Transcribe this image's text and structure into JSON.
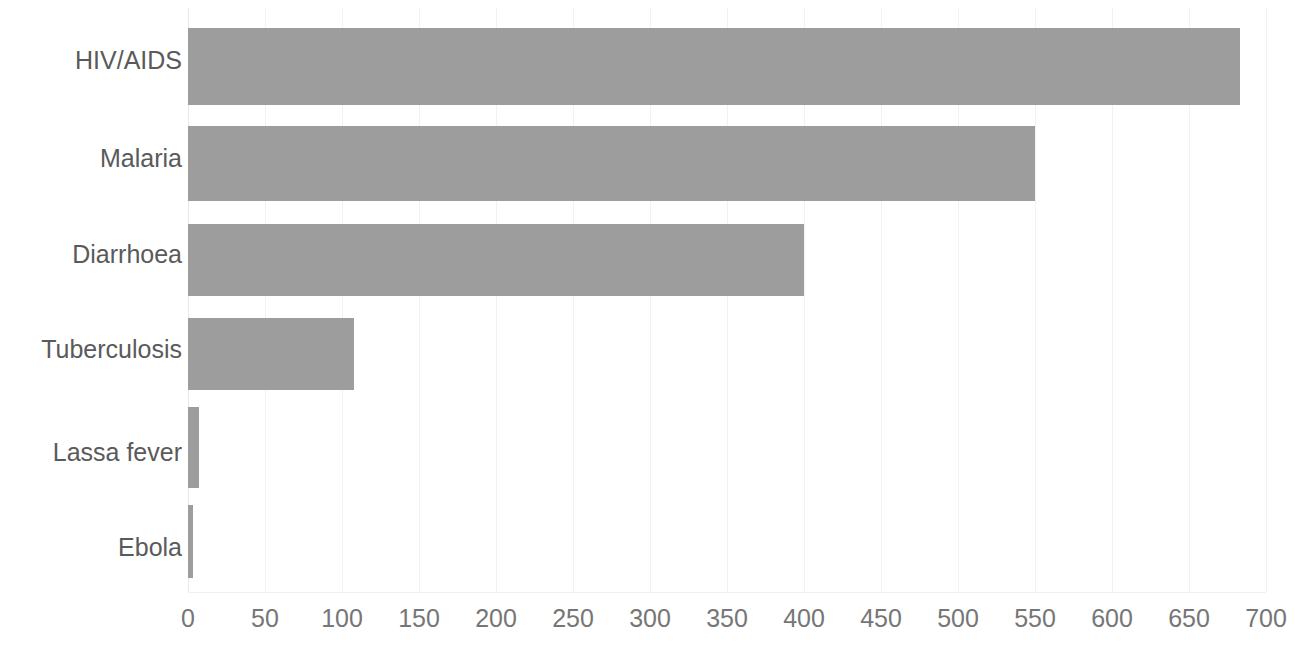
{
  "chart_data": {
    "type": "bar",
    "orientation": "horizontal",
    "title": "",
    "subtitle": "",
    "xlabel": "",
    "ylabel": "",
    "categories": [
      "HIV/AIDS",
      "Malaria",
      "Diarrhoea",
      "Tuberculosis",
      "Lassa fever",
      "Ebola"
    ],
    "values": [
      683,
      550,
      400,
      108,
      7,
      3
    ],
    "series": [
      {
        "name": "Deaths",
        "values": [
          683,
          550,
          400,
          108,
          7,
          3
        ]
      }
    ],
    "xlim": [
      0,
      700
    ],
    "xticks": [
      0,
      50,
      100,
      150,
      200,
      250,
      300,
      350,
      400,
      450,
      500,
      550,
      600,
      650,
      700
    ],
    "xtick_labels": [
      "0",
      "50",
      "100",
      "150",
      "200",
      "250",
      "300",
      "350",
      "400",
      "450",
      "500",
      "550",
      "600",
      "650",
      "700"
    ],
    "grid": true,
    "grid_axis": "x",
    "legend": false,
    "legend_position": "none",
    "bar_color": "#9d9d9d",
    "gridline_color": "#f2f2f2",
    "label_color": "#5a5a5a",
    "tick_color": "#767676",
    "background_color": "#ffffff",
    "annotations": []
  }
}
